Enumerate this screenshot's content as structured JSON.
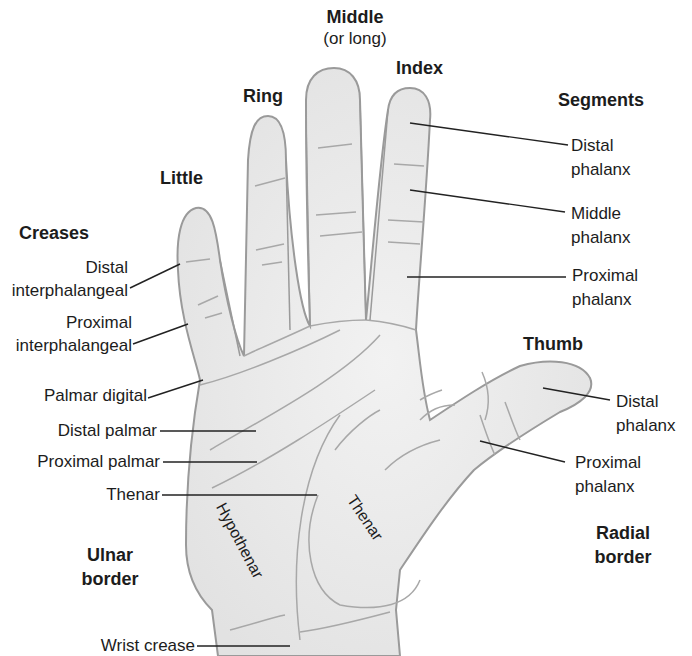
{
  "fingers": {
    "middle": "Middle",
    "middle_alt": "(or long)",
    "index": "Index",
    "ring": "Ring",
    "little": "Little",
    "thumb": "Thumb"
  },
  "segments": {
    "heading": "Segments",
    "distal": [
      "Distal",
      "phalanx"
    ],
    "middle": [
      "Middle",
      "phalanx"
    ],
    "proximal": [
      "Proximal",
      "phalanx"
    ]
  },
  "creases": {
    "heading": "Creases",
    "distal_ip": [
      "Distal",
      "interphalangeal"
    ],
    "proximal_ip": [
      "Proximal",
      "interphalangeal"
    ],
    "palmar_digital": "Palmar digital",
    "distal_palmar": "Distal palmar",
    "proximal_palmar": "Proximal palmar",
    "thenar": "Thenar",
    "wrist": "Wrist crease"
  },
  "thumb_segments": {
    "distal": [
      "Distal",
      "phalanx"
    ],
    "proximal": [
      "Proximal",
      "phalanx"
    ]
  },
  "regions": {
    "hypothenar": "Hypothenar",
    "thenar": "Thenar"
  },
  "borders": {
    "ulnar": [
      "Ulnar",
      "border"
    ],
    "radial": [
      "Radial",
      "border"
    ]
  },
  "colors": {
    "skin_fill": "#ececec",
    "outline": "#9a9a9a",
    "crease": "#a8a8a8",
    "leader": "#222222"
  }
}
